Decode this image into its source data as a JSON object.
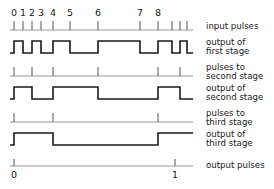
{
  "figure": {
    "colors": {
      "wave": "#1a1a1a",
      "axis": "#8f8f8f",
      "tick": "#6a6a6a",
      "background": "#ffffff"
    }
  },
  "scale": {
    "tick_x": [
      14,
      23,
      32,
      41,
      53,
      70,
      98,
      140,
      158,
      172,
      180,
      187
    ],
    "axis_start": 10,
    "axis_end": 193
  },
  "numbers": {
    "labels": [
      "0",
      "1",
      "2",
      "3",
      "4",
      "5",
      "6",
      "7",
      "8"
    ],
    "x": [
      14,
      23,
      32,
      41,
      53,
      70,
      98,
      140,
      158
    ],
    "y": 16
  },
  "rows": [
    {
      "id": "input-pulses",
      "label_lines": [
        "input pulses"
      ],
      "kind": "ticks",
      "baseline_y": 30,
      "tick_height": 9,
      "tick_x": [
        14,
        23,
        32,
        41,
        53,
        70,
        98,
        140,
        158,
        172,
        180,
        187
      ],
      "label_x": 206,
      "label_y": [
        29
      ]
    },
    {
      "id": "output-first-stage",
      "label_lines": [
        "output of",
        "first stage"
      ],
      "kind": "wave",
      "low_y": 53,
      "high_y": 41,
      "start_level": "low",
      "edges_x": [
        14,
        23,
        32,
        41,
        53,
        70,
        98,
        140,
        158,
        172,
        180,
        187
      ],
      "start_x": 10,
      "end_x": 193,
      "label_x": 206,
      "label_y": [
        45,
        54
      ]
    },
    {
      "id": "pulses-to-second-stage",
      "label_lines": [
        "pulses to",
        "second stage"
      ],
      "kind": "ticks",
      "baseline_y": 76,
      "tick_height": 9,
      "tick_x": [
        14,
        32,
        53,
        98,
        158,
        180
      ],
      "label_x": 206,
      "label_y": [
        70,
        79
      ]
    },
    {
      "id": "output-second-stage",
      "label_lines": [
        "output of",
        "second stage"
      ],
      "kind": "wave",
      "low_y": 99,
      "high_y": 87,
      "start_level": "low",
      "edges_x": [
        14,
        32,
        53,
        98,
        158,
        180
      ],
      "start_x": 10,
      "end_x": 193,
      "label_x": 206,
      "label_y": [
        91,
        100
      ]
    },
    {
      "id": "pulses-to-third-stage",
      "label_lines": [
        "pulses to",
        "third stage"
      ],
      "kind": "ticks",
      "baseline_y": 122,
      "tick_height": 9,
      "tick_x": [
        14,
        53,
        158
      ],
      "label_x": 206,
      "label_y": [
        116,
        125
      ]
    },
    {
      "id": "output-third-stage",
      "label_lines": [
        "output of",
        "third stage"
      ],
      "kind": "wave",
      "low_y": 145,
      "high_y": 133,
      "start_level": "low",
      "edges_x": [
        14,
        53,
        158
      ],
      "start_x": 10,
      "end_x": 193,
      "label_x": 206,
      "label_y": [
        137,
        146
      ]
    },
    {
      "id": "output-pulses",
      "label_lines": [
        "output pulses"
      ],
      "kind": "ticks",
      "baseline_y": 166,
      "tick_height": 7,
      "tick_x": [
        14,
        175
      ],
      "label_x": 206,
      "label_y": [
        168
      ]
    }
  ],
  "bottom_numbers": {
    "labels": [
      "0",
      "1"
    ],
    "x": [
      14,
      175
    ],
    "y": 178
  }
}
